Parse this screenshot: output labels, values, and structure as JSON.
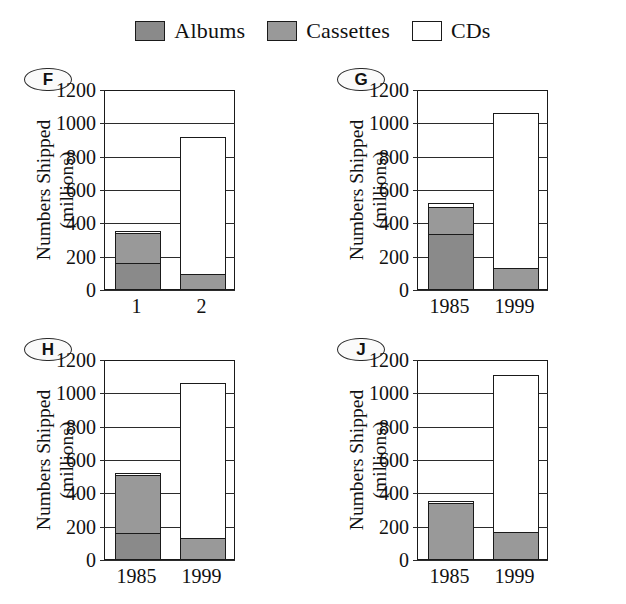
{
  "legend": {
    "entries": [
      {
        "label": "Albums",
        "color": "#8a8a8a",
        "swatch_name": "albums-swatch"
      },
      {
        "label": "Cassettes",
        "color": "#999999",
        "swatch_name": "cassettes-swatch"
      },
      {
        "label": "CDs",
        "color": "#ffffff",
        "swatch_name": "cds-swatch"
      }
    ]
  },
  "axis": {
    "y_title_line1": "Numbers Shipped",
    "y_title_line2": "(millions)",
    "y_ticks": [
      "1200",
      "1000",
      "800",
      "600",
      "400",
      "200",
      "0"
    ],
    "y_min": 0,
    "y_max": 1200
  },
  "chart_data": [
    {
      "id": "F",
      "type": "bar",
      "stacked": true,
      "title": "F",
      "xlabel": "",
      "ylabel": "Numbers Shipped (millions)",
      "ylim": [
        0,
        1200
      ],
      "categories": [
        "1",
        "2"
      ],
      "series": [
        {
          "name": "Albums",
          "color": "#8a8a8a",
          "values": [
            165,
            0
          ]
        },
        {
          "name": "Cassettes",
          "color": "#999999",
          "values": [
            175,
            95
          ]
        },
        {
          "name": "CDs",
          "color": "#ffffff",
          "values": [
            15,
            825
          ]
        }
      ],
      "totals": [
        355,
        920
      ],
      "grid": true,
      "legend_position": "top-center"
    },
    {
      "id": "G",
      "type": "bar",
      "stacked": true,
      "title": "G",
      "xlabel": "",
      "ylabel": "Numbers Shipped (millions)",
      "ylim": [
        0,
        1200
      ],
      "categories": [
        "1985",
        "1999"
      ],
      "series": [
        {
          "name": "Albums",
          "color": "#8a8a8a",
          "values": [
            335,
            0
          ]
        },
        {
          "name": "Cassettes",
          "color": "#999999",
          "values": [
            165,
            130
          ]
        },
        {
          "name": "CDs",
          "color": "#ffffff",
          "values": [
            20,
            935
          ]
        }
      ],
      "totals": [
        520,
        1065
      ],
      "grid": true,
      "legend_position": "top-center"
    },
    {
      "id": "H",
      "type": "bar",
      "stacked": true,
      "title": "H",
      "xlabel": "",
      "ylabel": "Numbers Shipped (millions)",
      "ylim": [
        0,
        1200
      ],
      "categories": [
        "1985",
        "1999"
      ],
      "series": [
        {
          "name": "Albums",
          "color": "#8a8a8a",
          "values": [
            165,
            0
          ]
        },
        {
          "name": "Cassettes",
          "color": "#999999",
          "values": [
            345,
            130
          ]
        },
        {
          "name": "CDs",
          "color": "#ffffff",
          "values": [
            15,
            935
          ]
        }
      ],
      "totals": [
        525,
        1065
      ],
      "grid": true,
      "legend_position": "top-center"
    },
    {
      "id": "J",
      "type": "bar",
      "stacked": true,
      "title": "J",
      "xlabel": "",
      "ylabel": "Numbers Shipped (millions)",
      "ylim": [
        0,
        1200
      ],
      "categories": [
        "1985",
        "1999"
      ],
      "series": [
        {
          "name": "Albums",
          "color": "#8a8a8a",
          "values": [
            0,
            0
          ]
        },
        {
          "name": "Cassettes",
          "color": "#999999",
          "values": [
            340,
            170
          ]
        },
        {
          "name": "CDs",
          "color": "#ffffff",
          "values": [
            15,
            940
          ]
        }
      ],
      "totals": [
        355,
        1110
      ],
      "grid": true,
      "legend_position": "top-center"
    }
  ]
}
